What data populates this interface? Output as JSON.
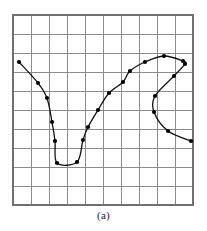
{
  "figure": {
    "caption": "(a)",
    "colors": {
      "grid": "#8a8a8a",
      "border": "#707070",
      "curve": "#111111",
      "marker": "#000000",
      "background": "#ffffff"
    }
  },
  "chart_data": {
    "type": "scatter",
    "title": "(a)",
    "subtitle": "",
    "xlabel": "",
    "ylabel": "",
    "grid": true,
    "legend": null,
    "axis_ticks_shown": false,
    "plot_box_px": {
      "x": 13,
      "y": 15,
      "width": 180,
      "height": 190
    },
    "grid_rows": 10,
    "grid_cols": 10,
    "cell_px": {
      "width": 18,
      "height": 19
    },
    "xlim": [
      0,
      10
    ],
    "ylim": [
      0,
      10
    ],
    "series": [
      {
        "name": "curve-1",
        "n_points": 22,
        "units": "grid cells (origin at lower-left of plot box)",
        "x": [
          0.33,
          1.39,
          1.89,
          2.17,
          2.33,
          2.44,
          3.56,
          3.89,
          4.17,
          4.72,
          5.33,
          6.11,
          6.5,
          7.33,
          8.39,
          9.44,
          9.56,
          8.94,
          7.89,
          7.83,
          8.61,
          9.89
        ],
        "y": [
          7.53,
          6.42,
          5.63,
          4.37,
          3.37,
          2.21,
          2.26,
          3.42,
          4.11,
          5.0,
          5.89,
          6.47,
          7.05,
          7.53,
          7.84,
          7.58,
          7.42,
          6.79,
          5.74,
          4.89,
          3.84,
          3.32
        ],
        "points_px": [
          {
            "x": 19,
            "y": 62
          },
          {
            "x": 38,
            "y": 83
          },
          {
            "x": 47,
            "y": 98
          },
          {
            "x": 52,
            "y": 122
          },
          {
            "x": 55,
            "y": 141
          },
          {
            "x": 57,
            "y": 163
          },
          {
            "x": 77,
            "y": 162
          },
          {
            "x": 83,
            "y": 140
          },
          {
            "x": 88,
            "y": 127
          },
          {
            "x": 98,
            "y": 110
          },
          {
            "x": 109,
            "y": 93
          },
          {
            "x": 123,
            "y": 82
          },
          {
            "x": 130,
            "y": 71
          },
          {
            "x": 145,
            "y": 62
          },
          {
            "x": 164,
            "y": 56
          },
          {
            "x": 183,
            "y": 61
          },
          {
            "x": 185,
            "y": 64
          },
          {
            "x": 174,
            "y": 76
          },
          {
            "x": 155,
            "y": 96
          },
          {
            "x": 154,
            "y": 112
          },
          {
            "x": 168,
            "y": 131
          },
          {
            "x": 191,
            "y": 141
          }
        ]
      }
    ]
  }
}
